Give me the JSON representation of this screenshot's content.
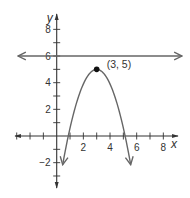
{
  "chart_data": {
    "type": "line",
    "title": "",
    "xlabel": "x",
    "ylabel": "y",
    "xlim": [
      -3,
      8
    ],
    "ylim": [
      -3,
      8
    ],
    "grid": false,
    "x_ticks": [
      -3,
      -2,
      -1,
      1,
      2,
      3,
      4,
      5,
      6,
      7,
      8
    ],
    "x_tick_labels": [
      {
        "value": 2,
        "text": "2"
      },
      {
        "value": 4,
        "text": "4"
      },
      {
        "value": 6,
        "text": "6"
      },
      {
        "value": 8,
        "text": "8"
      }
    ],
    "y_ticks": [
      -3,
      -2,
      -1,
      1,
      2,
      3,
      4,
      5,
      6,
      7,
      8
    ],
    "y_tick_labels": [
      {
        "value": 8,
        "text": "8"
      },
      {
        "value": 6,
        "text": "6"
      },
      {
        "value": 4,
        "text": "4"
      },
      {
        "value": 2,
        "text": "2"
      },
      {
        "value": -2,
        "text": "−2"
      }
    ],
    "series": [
      {
        "name": "horizontal line",
        "kind": "line",
        "equation": "y = 6",
        "x_range": [
          -3,
          9.3
        ],
        "arrows": "both"
      },
      {
        "name": "parabola",
        "kind": "parabola",
        "equation": "y = 5 - 1.1(x - 3)^2",
        "vertex": [
          3,
          5
        ],
        "a": -1.1,
        "x_range": [
          0.45,
          5.55
        ],
        "arrows": "both-ends-down"
      }
    ],
    "annotations": [
      {
        "point": [
          3,
          5
        ],
        "text": "(3, 5)",
        "marker": "filled-dot"
      }
    ],
    "colors": {
      "axis": "#333333",
      "curve": "#666666",
      "text": "#333333"
    }
  }
}
